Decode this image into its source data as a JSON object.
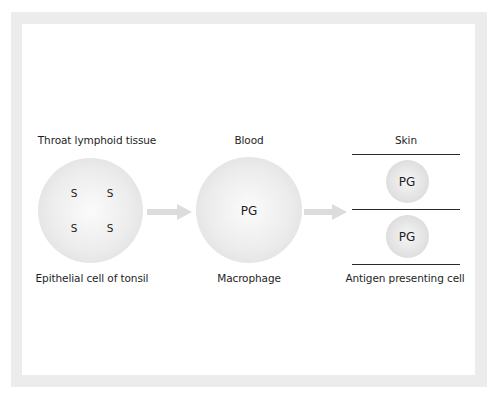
{
  "stages": [
    {
      "location": "Throat lymphoid tissue",
      "cell": "Epithelial cell of tonsil",
      "markers": [
        "S",
        "S",
        "S",
        "S"
      ]
    },
    {
      "location": "Blood",
      "cell": "Macrophage",
      "markers": [
        "PG"
      ]
    },
    {
      "location": "Skin",
      "cell": "Antigen presenting cell",
      "markers": [
        "PG",
        "PG"
      ]
    }
  ],
  "colors": {
    "frame": "#ececec",
    "arrow": "#dcdcdc",
    "text": "#1e1e1e",
    "line": "#2a2a2a"
  }
}
